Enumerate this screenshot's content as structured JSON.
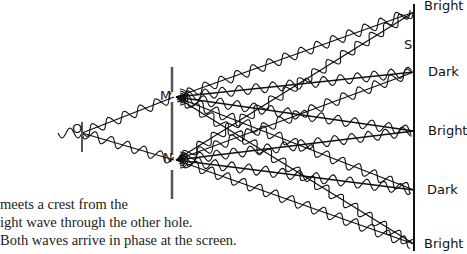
{
  "diagram": {
    "source_label": "O",
    "slit_labels": [
      "M",
      "N"
    ],
    "screen_label": "S",
    "screen_bands": [
      {
        "label": "Bright",
        "y": 12
      },
      {
        "label": "Dark",
        "y": 72
      },
      {
        "label": "Bright",
        "y": 131
      },
      {
        "label": "Dark",
        "y": 190
      },
      {
        "label": "Bright",
        "y": 244
      }
    ]
  },
  "caption": {
    "lines": [
      "meets a crest from the",
      "ight wave through the other hole.",
      "Both waves arrive in phase at the screen."
    ]
  },
  "colors": {
    "ink": "#111111",
    "barrier": "#666666"
  }
}
